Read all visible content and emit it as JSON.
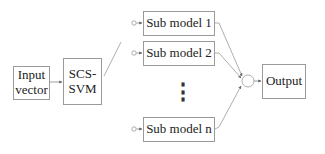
{
  "diagram": {
    "input": {
      "line1": "Input",
      "line2": "vector"
    },
    "classifier": {
      "line1": "SCS-",
      "line2": "SVM"
    },
    "sub_models": [
      {
        "label": "Sub model 1"
      },
      {
        "label": "Sub model 2"
      },
      {
        "label": "Sub model n"
      }
    ],
    "ellipsis": "⋮",
    "combiner": "summing-node",
    "output": {
      "label": "Output"
    },
    "colors": {
      "line": "#8a8a8a",
      "border": "#9a9a9a",
      "text": "#222222"
    }
  }
}
